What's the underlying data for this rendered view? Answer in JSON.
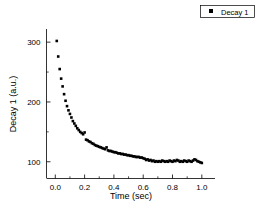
{
  "chart_data": {
    "type": "scatter",
    "title": "",
    "subtitle": "",
    "xlabel": "Time (sec)",
    "ylabel": "Decay 1 (a.u.)",
    "xlim": [
      -0.06,
      1.09
    ],
    "ylim": [
      72,
      322
    ],
    "xticks": [
      0.0,
      0.2,
      0.4,
      0.6,
      0.8,
      1.0
    ],
    "xtick_labels": [
      "0.0",
      "0.2",
      "0.4",
      "0.6",
      "0.8",
      "1.0"
    ],
    "yticks": [
      100,
      200,
      300
    ],
    "ytick_labels": [
      "100",
      "200",
      "300"
    ],
    "minor_xticks": [
      0.1,
      0.3,
      0.5,
      0.7,
      0.9
    ],
    "minor_yticks": [
      150,
      250
    ],
    "grid": false,
    "legend_position": "top-right",
    "marker": "square",
    "marker_color": "#000000",
    "marker_size": 2.6,
    "axis_color": "#000000",
    "series": [
      {
        "name": "Decay 1",
        "x": [
          0.01,
          0.02,
          0.03,
          0.04,
          0.05,
          0.06,
          0.07,
          0.08,
          0.09,
          0.1,
          0.11,
          0.12,
          0.13,
          0.14,
          0.15,
          0.16,
          0.17,
          0.18,
          0.19,
          0.2,
          0.21,
          0.22,
          0.23,
          0.24,
          0.25,
          0.26,
          0.27,
          0.28,
          0.29,
          0.3,
          0.31,
          0.32,
          0.33,
          0.34,
          0.35,
          0.36,
          0.37,
          0.38,
          0.39,
          0.4,
          0.41,
          0.42,
          0.43,
          0.44,
          0.45,
          0.46,
          0.47,
          0.48,
          0.49,
          0.5,
          0.51,
          0.52,
          0.53,
          0.54,
          0.55,
          0.56,
          0.57,
          0.58,
          0.59,
          0.6,
          0.61,
          0.62,
          0.63,
          0.64,
          0.65,
          0.66,
          0.67,
          0.68,
          0.69,
          0.7,
          0.71,
          0.72,
          0.73,
          0.74,
          0.75,
          0.76,
          0.77,
          0.78,
          0.79,
          0.8,
          0.81,
          0.82,
          0.83,
          0.84,
          0.85,
          0.86,
          0.87,
          0.88,
          0.89,
          0.9,
          0.91,
          0.92,
          0.93,
          0.94,
          0.95,
          0.96,
          0.97,
          0.98,
          0.99,
          1.0
        ],
        "y": [
          302,
          276,
          255,
          239,
          226,
          213,
          202,
          193,
          186,
          180,
          174,
          168,
          164,
          160,
          156,
          153,
          150,
          148,
          146,
          149,
          137,
          136,
          134,
          133,
          131,
          130,
          128,
          127,
          126,
          125,
          124,
          123,
          122,
          121,
          124,
          119,
          118,
          118,
          117,
          116,
          116,
          115,
          114,
          114,
          113,
          113,
          112,
          112,
          111,
          111,
          110,
          110,
          109,
          109,
          108,
          108,
          108,
          107,
          107,
          106,
          105,
          103,
          104,
          102,
          103,
          101,
          102,
          100,
          101,
          100,
          101,
          100,
          102,
          101,
          100,
          101,
          100,
          102,
          101,
          100,
          102,
          101,
          103,
          102,
          100,
          101,
          100,
          102,
          101,
          100,
          102,
          101,
          100,
          102,
          104,
          103,
          101,
          100,
          99,
          98
        ]
      }
    ],
    "legend": [
      {
        "label": "Decay 1",
        "marker": "square",
        "color": "#000000"
      }
    ]
  },
  "figure": {
    "caption": "",
    "background": "#ffffff"
  }
}
